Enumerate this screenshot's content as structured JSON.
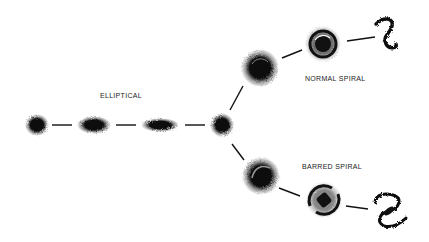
{
  "diagram": {
    "labels": {
      "elliptical": "ELLIPTICAL",
      "normal_spiral": "NORMAL SPIRAL",
      "barred_spiral": "BARRED SPIRAL"
    },
    "branches": [
      {
        "name": "elliptical",
        "nodes": [
          "E0",
          "E3",
          "E6",
          "S0"
        ]
      },
      {
        "name": "normal-spiral",
        "nodes": [
          "Sa",
          "Sb",
          "Sc"
        ]
      },
      {
        "name": "barred-spiral",
        "nodes": [
          "SBa",
          "SBb",
          "SBc"
        ]
      }
    ],
    "colors": {
      "ink": "#111111",
      "background": "#ffffff"
    }
  }
}
